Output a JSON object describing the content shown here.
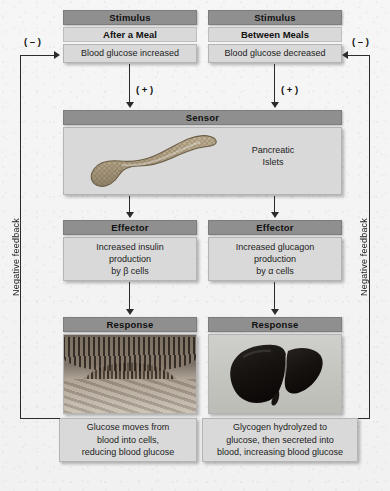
{
  "diagram": {
    "left_pathway": {
      "stimulus_header": "Stimulus",
      "stimulus_condition": "After a Meal",
      "stimulus_detail": "Blood glucose increased",
      "to_sensor_sign": "( + )",
      "effector_header": "Effector",
      "effector_detail": "Increased insulin\nproduction\nby β cells",
      "effector_line1": "Increased insulin",
      "effector_line2": "production",
      "effector_line3": "by β cells",
      "response_header": "Response",
      "response_image": "intestinal-histology-micrograph",
      "response_detail_line1": "Glucose moves from",
      "response_detail_line2": "blood into cells,",
      "response_detail_line3": "reducing blood glucose",
      "feedback_label": "Negative feedback",
      "feedback_sign": "( – )"
    },
    "right_pathway": {
      "stimulus_header": "Stimulus",
      "stimulus_condition": "Between Meals",
      "stimulus_detail": "Blood glucose decreased",
      "to_sensor_sign": "( + )",
      "effector_header": "Effector",
      "effector_line1": "Increased glucagon",
      "effector_line2": "production",
      "effector_line3": "by α cells",
      "response_header": "Response",
      "response_image": "liver-organ-photograph",
      "response_detail_line1": "Glycogen hydrolyzed to",
      "response_detail_line2": "glucose, then secreted into",
      "response_detail_line3": "blood, increasing blood glucose",
      "feedback_label": "Negative feedback",
      "feedback_sign": "( – )"
    },
    "sensor": {
      "header": "Sensor",
      "image": "pancreas-organ-illustration",
      "label_line1": "Pancreatic",
      "label_line2": "Islets"
    },
    "colors": {
      "header_bar": "#8f8f8f",
      "box_body": "#d9d9d9",
      "box_border": "#b4b4b4",
      "arrow": "#2b2b2b",
      "background": "#f4f4f4"
    }
  }
}
